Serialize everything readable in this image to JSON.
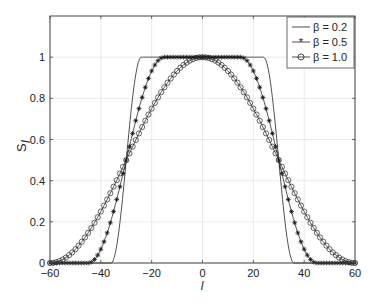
{
  "chart_data": {
    "type": "line",
    "title": "",
    "xlabel": "l",
    "ylabel": "S_l",
    "xlim": [
      -60,
      60
    ],
    "ylim": [
      0,
      1.2
    ],
    "grid": true,
    "legend_position": "upper right",
    "x_ticks": [
      -60,
      -40,
      -20,
      0,
      20,
      40,
      60
    ],
    "y_ticks": [
      0,
      0.2,
      0.4,
      0.6,
      0.8,
      1
    ],
    "x_tick_labels": [
      "-60",
      "-40",
      "-20",
      "0",
      "20",
      "40",
      "60"
    ],
    "y_tick_labels": [
      "0",
      "0.2",
      "0.4",
      "0.6",
      "0.8",
      "1"
    ],
    "model": "raised-cosine spectrum with half-width W=30: S=1 for |l|<=(1-β)W; 0.5[1+cos(π(|l|-(1-β)W)/(2βW))] for (1-β)W<|l|<=(1+β)W; else 0",
    "half_width": 30,
    "series": [
      {
        "name": "β = 0.2",
        "beta": 0.2,
        "marker": "none",
        "flat_until": 24,
        "zero_at": 36
      },
      {
        "name": "β = 0.5",
        "beta": 0.5,
        "marker": "star",
        "flat_until": 15,
        "zero_at": 45
      },
      {
        "name": "β = 1.0",
        "beta": 1.0,
        "marker": "circle",
        "flat_until": 0,
        "zero_at": 60
      }
    ],
    "sample_points": {
      "x": [
        -60,
        -45,
        -36,
        -30,
        -24,
        -15,
        0,
        15,
        24,
        30,
        36,
        45,
        60
      ],
      "beta_0_2": [
        0,
        0,
        0,
        0.5,
        1,
        1,
        1,
        1,
        1,
        0.5,
        0,
        0,
        0
      ],
      "beta_0_5": [
        0,
        0,
        0.21,
        0.5,
        0.79,
        1,
        1,
        1,
        0.79,
        0.5,
        0.21,
        0,
        0
      ],
      "beta_1_0": [
        0,
        0.15,
        0.35,
        0.5,
        0.65,
        0.85,
        1,
        0.85,
        0.65,
        0.5,
        0.35,
        0.15,
        0
      ]
    }
  },
  "axes": {
    "xlabel": "l",
    "ylabel_main": "S",
    "ylabel_sub": "l"
  },
  "legend": {
    "items": [
      {
        "label": "β = 0.2",
        "marker": "none"
      },
      {
        "label": "β = 0.5",
        "marker": "star"
      },
      {
        "label": "β = 1.0",
        "marker": "circle"
      }
    ]
  }
}
